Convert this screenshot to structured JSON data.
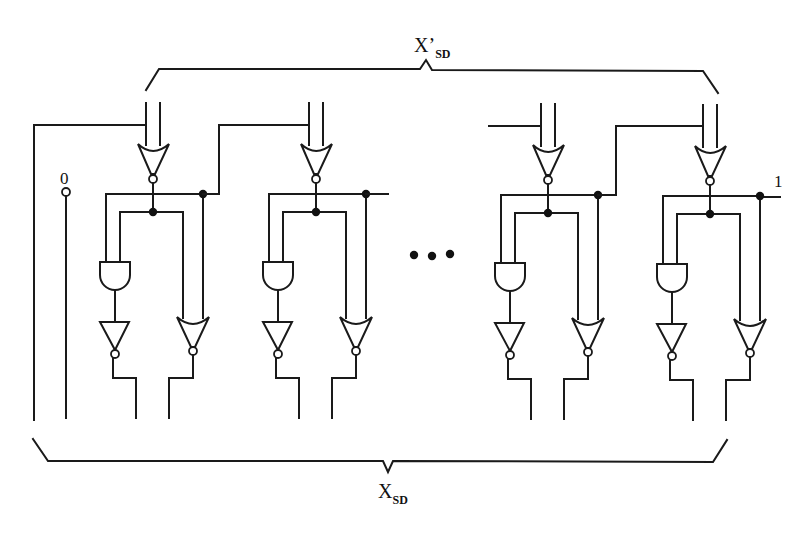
{
  "figure": {
    "type": "logic-circuit-schematic",
    "colors": {
      "ink": "#1a1a1a",
      "background": "#ffffff"
    }
  },
  "labels": {
    "top_bus": {
      "main": "X",
      "prime": "’",
      "sub": "SD"
    },
    "bottom_bus": {
      "main": "X",
      "sub": "SD"
    },
    "left_constant": "0",
    "right_constant": "1",
    "ellipsis": "• • •"
  },
  "cells": [
    {
      "id": "cell-1",
      "offset": 0,
      "gates": [
        "nor-input",
        "and",
        "inverter",
        "nor-output"
      ]
    },
    {
      "id": "cell-2",
      "offset": 163,
      "gates": [
        "nor-input",
        "and",
        "inverter",
        "nor-output"
      ]
    },
    {
      "id": "cell-3",
      "offset": 395,
      "gates": [
        "nor-input",
        "and",
        "inverter",
        "nor-output"
      ]
    },
    {
      "id": "cell-4",
      "offset": 557,
      "gates": [
        "nor-input",
        "and",
        "inverter",
        "nor-output"
      ]
    }
  ]
}
